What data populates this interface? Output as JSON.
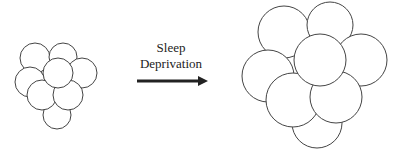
{
  "diagram": {
    "label_line1": "Sleep",
    "label_line2": "Deprivation",
    "stroke_color": "#444444",
    "small_cluster": [
      {
        "cx": 35,
        "cy": 58,
        "r": 15
      },
      {
        "cx": 63,
        "cy": 57,
        "r": 14
      },
      {
        "cx": 30,
        "cy": 82,
        "r": 15
      },
      {
        "cx": 82,
        "cy": 73,
        "r": 15
      },
      {
        "cx": 57,
        "cy": 115,
        "r": 14
      },
      {
        "cx": 42,
        "cy": 95,
        "r": 15
      },
      {
        "cx": 68,
        "cy": 95,
        "r": 15
      },
      {
        "cx": 58,
        "cy": 73,
        "r": 15
      }
    ],
    "large_cluster": [
      {
        "cx": 284,
        "cy": 32,
        "r": 26
      },
      {
        "cx": 330,
        "cy": 25,
        "r": 23
      },
      {
        "cx": 268,
        "cy": 76,
        "r": 26
      },
      {
        "cx": 361,
        "cy": 60,
        "r": 26
      },
      {
        "cx": 317,
        "cy": 123,
        "r": 25
      },
      {
        "cx": 293,
        "cy": 100,
        "r": 27
      },
      {
        "cx": 336,
        "cy": 97,
        "r": 26
      },
      {
        "cx": 320,
        "cy": 60,
        "r": 26
      }
    ]
  }
}
